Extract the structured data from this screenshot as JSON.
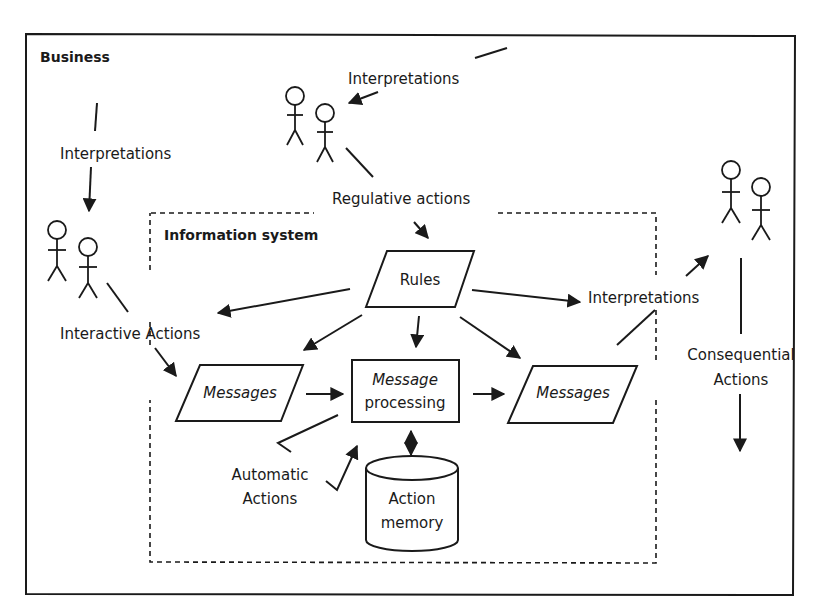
{
  "diagram": {
    "outer_frame": {
      "label": "Business"
    },
    "inner_frame": {
      "label": "Information system"
    },
    "nodes": {
      "rules": {
        "label": "Rules",
        "shape": "parallelogram"
      },
      "messages_in": {
        "label": "Messages",
        "shape": "parallelogram"
      },
      "message_processing": {
        "line1": "Message",
        "line2": "processing",
        "shape": "rectangle"
      },
      "messages_out": {
        "label": "Messages",
        "shape": "parallelogram"
      },
      "action_memory": {
        "line1": "Action",
        "line2": "memory",
        "shape": "cylinder"
      }
    },
    "actors": {
      "left": {
        "count": 2,
        "icon": "stick-figure-icon"
      },
      "top": {
        "count": 2,
        "icon": "stick-figure-icon"
      },
      "right": {
        "count": 2,
        "icon": "stick-figure-icon"
      }
    },
    "labels": {
      "interpretations_top": "Interpretations",
      "interpretations_left": "Interpretations",
      "regulative_actions": "Regulative actions",
      "interactive_actions": "Interactive Actions",
      "interpretations_right": "Interpretations",
      "consequential_line1": "Consequential",
      "consequential_line2": "Actions",
      "automatic_line1": "Automatic",
      "automatic_line2": "Actions"
    },
    "colors": {
      "stroke": "#1a1a1a",
      "background": "#ffffff"
    }
  }
}
